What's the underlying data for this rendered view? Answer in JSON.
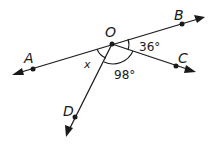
{
  "diagram": {
    "title": "",
    "vertex": {
      "label": "O",
      "x": 112,
      "y": 44
    },
    "points": {
      "A": {
        "label": "A",
        "x": 33,
        "y": 69
      },
      "B": {
        "label": "B",
        "x": 182,
        "y": 24
      },
      "C": {
        "label": "C",
        "x": 176,
        "y": 66
      },
      "D": {
        "label": "D",
        "x": 75,
        "y": 117
      }
    },
    "rays": [
      {
        "name": "ray-OA",
        "from": "O",
        "through": "A"
      },
      {
        "name": "ray-OB",
        "from": "O",
        "through": "B"
      },
      {
        "name": "ray-OC",
        "from": "O",
        "through": "C"
      },
      {
        "name": "ray-OD",
        "from": "O",
        "through": "D"
      }
    ],
    "angles": {
      "BOC": {
        "label": "36°",
        "value": 36
      },
      "COD": {
        "label": "98°",
        "value": 98
      },
      "AOD": {
        "label": "x",
        "value": null
      }
    },
    "colors": {
      "ink": "#1a1a1a",
      "background": "#ffffff"
    }
  }
}
